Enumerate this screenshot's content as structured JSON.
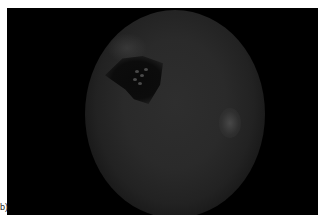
{
  "figure": {
    "panel_label": "b)",
    "image": {
      "kind": "fundus-photograph",
      "description": "Dark retinal fundus image with a dark pigmented lesion in upper-left region and a pale bright spot on the right"
    },
    "colors": {
      "background": "#000000",
      "fundus": "#2a2a2a",
      "lesion": "#0a0a0a",
      "bright_spot": "#4b4b4b"
    }
  }
}
